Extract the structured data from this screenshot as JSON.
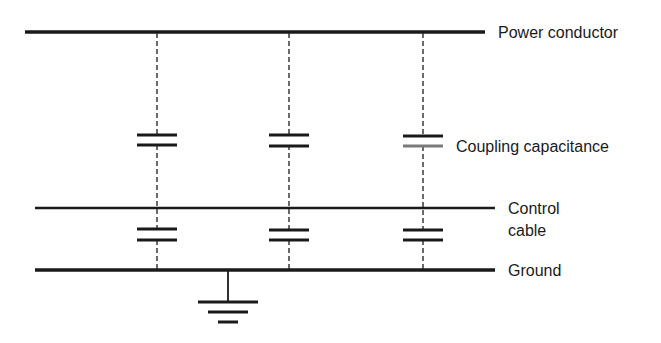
{
  "diagram": {
    "labels": {
      "power_conductor": "Power conductor",
      "coupling_capacitance": "Coupling capacitance",
      "control_cable_line1": "Control",
      "control_cable_line2": "cable",
      "ground": "Ground"
    },
    "colors": {
      "line": "#1a1a1a",
      "background": "#ffffff"
    },
    "conductors": [
      {
        "name": "Power conductor",
        "y": 32,
        "x1": 25,
        "x2": 485,
        "stroke": 3.5
      },
      {
        "name": "Control cable",
        "y": 208,
        "x1": 35,
        "x2": 495,
        "stroke": 2.5
      },
      {
        "name": "Ground",
        "y": 270,
        "x1": 35,
        "x2": 495,
        "stroke": 3.5
      }
    ],
    "coupling_branches_x": [
      157,
      289,
      423
    ],
    "capacitors_upper_y": [
      135,
      145
    ],
    "capacitors_lower_y": [
      229,
      240
    ],
    "ground_symbol": {
      "x": 228,
      "top": 270,
      "bars": [
        {
          "y": 302,
          "half": 30
        },
        {
          "y": 312,
          "half": 20
        },
        {
          "y": 322,
          "half": 10
        }
      ]
    }
  }
}
